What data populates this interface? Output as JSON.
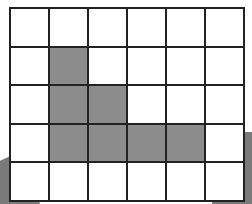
{
  "diagram": {
    "type": "grid",
    "rows": 5,
    "columns": 6,
    "colors": {
      "empty": "#ffffff",
      "filled": "#8c8c8c",
      "line": "#222222",
      "shadow": "#7a7a7a"
    },
    "cells": [
      [
        0,
        0,
        0,
        0,
        0,
        0
      ],
      [
        0,
        1,
        0,
        0,
        0,
        0
      ],
      [
        0,
        1,
        1,
        0,
        0,
        0
      ],
      [
        0,
        1,
        1,
        1,
        1,
        0
      ],
      [
        0,
        0,
        0,
        0,
        0,
        0
      ]
    ]
  }
}
